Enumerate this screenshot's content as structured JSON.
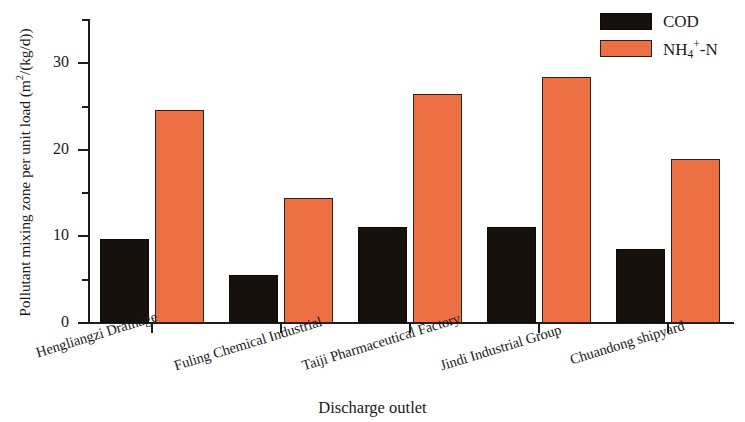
{
  "chart_data": {
    "type": "bar",
    "title": "",
    "xlabel": "Discharge outlet",
    "ylabel": "Pollutant mixing zone per unit load (m2/(kg/d))",
    "ylabel_parts": {
      "prefix": "Pollutant mixing zone per unit load (m",
      "exponent": "2",
      "suffix": "/(kg/d))"
    },
    "categories": [
      "Hengliangzi Drainage",
      "Fuling Chemical Industrial",
      "Taiji Pharmaceutical Factory",
      "Jindi Industrial Group",
      "Chuandong shipyard"
    ],
    "series": [
      {
        "name": "COD",
        "color": "#17110d",
        "values": [
          9.7,
          5.6,
          11.1,
          11.1,
          8.6
        ]
      },
      {
        "name": "NH4+-N",
        "color": "#ec7043",
        "values": [
          24.6,
          14.4,
          26.5,
          28.4,
          18.9
        ]
      }
    ],
    "ylim": [
      0,
      35
    ],
    "y_major_ticks": [
      0,
      10,
      20,
      30
    ],
    "y_major_tick_labels": [
      "0",
      "10",
      "20",
      "30"
    ],
    "y_minor_ticks": [
      5,
      15,
      25,
      35
    ],
    "grid": false,
    "legend_position": "top-right"
  },
  "legend": {
    "entries": [
      {
        "label": "COD",
        "color": "#17110d"
      },
      {
        "label_prefix": "NH",
        "label_sub": "4",
        "label_sup": "+",
        "label_suffix": "-N",
        "color": "#ec7043"
      }
    ]
  }
}
